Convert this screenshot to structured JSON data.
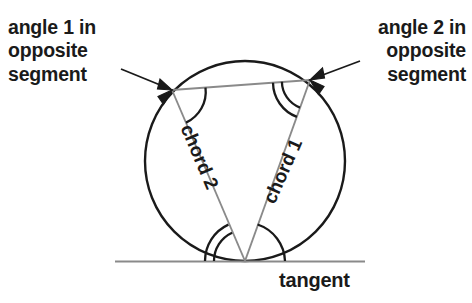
{
  "diagram": {
    "background_color": "#ffffff",
    "stroke_color": "#1a1a1a",
    "chord_stroke_color": "#6e6e6e",
    "tangent_stroke_color": "#8a8a8a",
    "labels": {
      "angle1": "angle 1 in\nopposite\nsegment",
      "angle2": "angle 2 in\nopposite\nsegment",
      "chord1": "chord 1",
      "chord2": "chord 2",
      "tangent": "tangent"
    },
    "geometry": {
      "circle": {
        "cx": 245,
        "cy": 161,
        "r": 100
      },
      "tangent_line": {
        "x1": 115,
        "y1": 261,
        "x2": 365,
        "y2": 261
      },
      "tangent_point": {
        "x": 245,
        "y": 261
      },
      "chord1": {
        "x1": 310,
        "y1": 80,
        "x2": 245,
        "y2": 261
      },
      "chord2": {
        "x1": 172,
        "y1": 90,
        "x2": 245,
        "y2": 261
      },
      "top_chord": {
        "x1": 172,
        "y1": 90,
        "x2": 310,
        "y2": 80
      },
      "angle_marks": [
        {
          "name": "angle-1-vertex-arc",
          "arcs": 1,
          "at": {
            "x": 172,
            "y": 90
          }
        },
        {
          "name": "angle-2-vertex-arc",
          "arcs": 2,
          "at": {
            "x": 310,
            "y": 80
          }
        },
        {
          "name": "tangent-left-arc",
          "arcs": 2,
          "at": {
            "x": 245,
            "y": 261
          }
        },
        {
          "name": "tangent-right-arc",
          "arcs": 1,
          "at": {
            "x": 245,
            "y": 261
          }
        }
      ],
      "leaders": [
        {
          "name": "leader-angle1",
          "from": {
            "x": 123,
            "y": 70
          },
          "to": {
            "x": 172,
            "y": 90
          }
        },
        {
          "name": "leader-angle2",
          "from": {
            "x": 358,
            "y": 62
          },
          "to": {
            "x": 310,
            "y": 80
          }
        }
      ]
    }
  }
}
